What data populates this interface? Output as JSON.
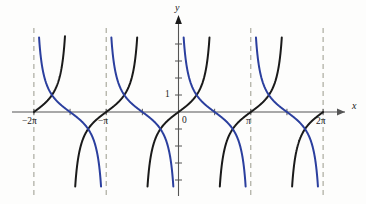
{
  "figure": {
    "background_color": "#fdfdfc",
    "width": 366,
    "height": 204
  },
  "axes": {
    "x_axis_label": "x",
    "y_axis_label": "y",
    "origin_label": "0",
    "y_unit_label": "1",
    "axis_color": "#555555",
    "asymptote_color": "#9a9a8c"
  },
  "x_tick_labels": [
    {
      "text": "−2π",
      "x_value": -6.2832
    },
    {
      "text": "−π",
      "x_value": -3.1416
    },
    {
      "text": "π",
      "x_value": 3.1416
    },
    {
      "text": "2π",
      "x_value": 6.2832
    }
  ],
  "y_tick_labels": [
    {
      "text": "1",
      "y_value": 1
    }
  ],
  "chart_data": {
    "type": "line",
    "title": "",
    "subtitle": "",
    "xlabel": "x",
    "ylabel": "y",
    "xlim": [
      -7.4,
      7.4
    ],
    "ylim": [
      -4.8,
      4.8
    ],
    "grid": false,
    "legend": null,
    "x_ticks": [
      -6.2832,
      -4.7124,
      -3.1416,
      -1.5708,
      0,
      1.5708,
      3.1416,
      4.7124,
      6.2832
    ],
    "x_tick_text": [
      "−2π",
      "",
      "−π",
      "",
      "0",
      "",
      "π",
      "",
      "2π"
    ],
    "y_ticks": [
      -4,
      -3,
      -2,
      -1,
      0,
      1,
      2,
      3,
      4
    ],
    "y_tick_text": [
      "",
      "",
      "",
      "",
      "0",
      "1",
      "",
      "",
      ""
    ],
    "asymptotes": {
      "description": "vertical dashed lines",
      "x_values": [
        -6.2832,
        -3.1416,
        0,
        3.1416,
        6.2832
      ]
    },
    "series": [
      {
        "name": "tan(x)",
        "color": "#1a1a1a",
        "function": "tan",
        "linewidth": 2.0,
        "asymptotes_at": [
          -4.7124,
          -1.5708,
          1.5708,
          4.7124
        ],
        "branches": [
          {
            "domain": [
              -6.2832,
              -4.7124
            ],
            "note": "rises from 0 at -2pi to +inf at -3pi/2"
          },
          {
            "domain": [
              -4.7124,
              -1.5708
            ],
            "note": "rises from -inf at -3pi/2 through 0 at -pi to +inf at -pi/2"
          },
          {
            "domain": [
              -1.5708,
              1.5708
            ],
            "note": "rises from -inf at -pi/2 through origin to +inf at pi/2"
          },
          {
            "domain": [
              1.5708,
              4.7124
            ],
            "note": "rises from -inf at pi/2 through 0 at pi to +inf at 3pi/2"
          },
          {
            "domain": [
              4.7124,
              6.2832
            ],
            "note": "rises from -inf at 3pi/2 to 0 at 2pi"
          }
        ],
        "sample_points": [
          {
            "x": -6.2832,
            "y": 0
          },
          {
            "x": -3.1416,
            "y": 0
          },
          {
            "x": -0.7854,
            "y": -1
          },
          {
            "x": 0,
            "y": 0
          },
          {
            "x": 0.7854,
            "y": 1
          },
          {
            "x": 3.1416,
            "y": 0
          },
          {
            "x": 6.2832,
            "y": 0
          }
        ]
      },
      {
        "name": "cot(x)",
        "color": "#2b3f9e",
        "function": "cot",
        "linewidth": 2.0,
        "asymptotes_at": [
          -6.2832,
          -3.1416,
          0,
          3.1416,
          6.2832
        ],
        "branches": [
          {
            "domain": [
              -6.2832,
              -3.1416
            ],
            "note": "falls from +inf at -2pi through 0 at -3pi/2 to -inf at -pi"
          },
          {
            "domain": [
              -3.1416,
              0
            ],
            "note": "falls from +inf at -pi through 0 at -pi/2 to -inf at 0"
          },
          {
            "domain": [
              0,
              3.1416
            ],
            "note": "falls from +inf at 0 through 0 at pi/2 to -inf at pi"
          },
          {
            "domain": [
              3.1416,
              6.2832
            ],
            "note": "falls from +inf at pi through 0 at 3pi/2 to -inf at 2pi"
          }
        ],
        "sample_points": [
          {
            "x": -4.7124,
            "y": 0
          },
          {
            "x": -1.5708,
            "y": 0
          },
          {
            "x": 0.7854,
            "y": 1
          },
          {
            "x": 1.5708,
            "y": 0
          },
          {
            "x": 2.3562,
            "y": -1
          },
          {
            "x": 4.7124,
            "y": 0
          }
        ]
      }
    ]
  }
}
